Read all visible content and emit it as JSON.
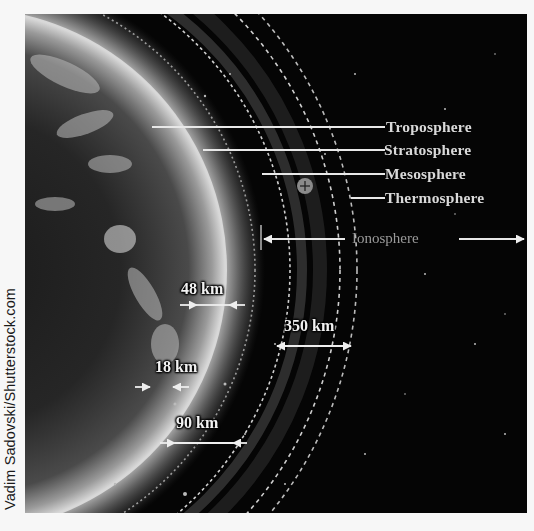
{
  "credit": "Vadim Sadovski/Shutterstock.com",
  "diagram": {
    "layers": [
      {
        "label": "Troposphere"
      },
      {
        "label": "Stratosphere"
      },
      {
        "label": "Mesosphere"
      },
      {
        "label": "Thermosphere"
      }
    ],
    "ionosphere_label": "Ionosphere",
    "distances": [
      {
        "label": "18 km"
      },
      {
        "label": "48 km"
      },
      {
        "label": "90 km"
      },
      {
        "label": "350 km"
      }
    ],
    "symbol": "⊕",
    "colors": {
      "background": "#050505",
      "label_text": "#d9d9d9",
      "ionosphere_text": "#9a9a9a",
      "page": "#f7f7f7"
    }
  }
}
